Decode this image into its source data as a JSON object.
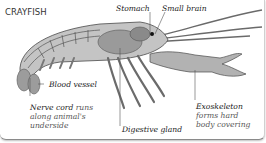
{
  "diagram": {
    "title": "CRAYFISH",
    "labels": {
      "stomach": "Stomach",
      "small_brain": "Small brain",
      "blood_vessel": "Blood vessel",
      "nerve_cord_head": "Nerve cord",
      "nerve_cord_rest1": "runs",
      "nerve_cord_line2": "along animal's",
      "nerve_cord_line3": "underside",
      "digestive_gland": "Digestive gland",
      "exoskeleton_head": "Exoskeleton",
      "exoskeleton_line2": "forms hard",
      "exoskeleton_line3": "body covering"
    },
    "colors": {
      "outline": "#4a4a4a",
      "shell": "#b9b9b9",
      "shell_light": "#d8d8d8",
      "organ": "#8f8f8f",
      "leader_line": "#555555",
      "eye": "#111111"
    }
  }
}
